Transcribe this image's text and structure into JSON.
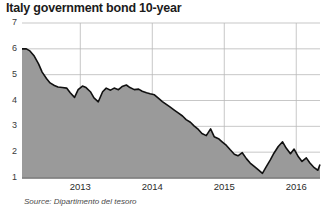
{
  "chart_data": {
    "type": "area",
    "title": "Italy government bond 10-year",
    "subtitle": "",
    "xlabel": "",
    "ylabel": "",
    "source": "Source: Dipartimento del tesoro",
    "ylim": [
      1,
      7
    ],
    "yticks": [
      1,
      2,
      3,
      4,
      5,
      6,
      7
    ],
    "ytick_labels": [
      "1",
      "2",
      "3",
      "4",
      "5",
      "6",
      "7"
    ],
    "xticks": [
      2013,
      2014,
      2015,
      2016
    ],
    "xtick_labels": [
      "2013",
      "2014",
      "2015",
      "2016"
    ],
    "xlim": [
      2012.19,
      2016.33
    ],
    "grid": true,
    "legend": "none",
    "series": [
      {
        "name": "Italy 10-year government bond yield",
        "units": "percent",
        "x": [
          2012.19,
          2012.25,
          2012.3,
          2012.36,
          2012.42,
          2012.47,
          2012.53,
          2012.58,
          2012.64,
          2012.69,
          2012.75,
          2012.81,
          2012.86,
          2012.92,
          2012.97,
          2013.03,
          2013.08,
          2013.14,
          2013.19,
          2013.25,
          2013.31,
          2013.36,
          2013.42,
          2013.47,
          2013.53,
          2013.58,
          2013.64,
          2013.69,
          2013.75,
          2013.81,
          2013.86,
          2013.92,
          2013.97,
          2014.03,
          2014.08,
          2014.14,
          2014.19,
          2014.25,
          2014.31,
          2014.36,
          2014.42,
          2014.47,
          2014.53,
          2014.58,
          2014.64,
          2014.69,
          2014.75,
          2014.81,
          2014.86,
          2014.92,
          2014.97,
          2015.03,
          2015.08,
          2015.14,
          2015.19,
          2015.25,
          2015.31,
          2015.36,
          2015.42,
          2015.47,
          2015.53,
          2015.58,
          2015.64,
          2015.69,
          2015.75,
          2015.81,
          2015.86,
          2015.92,
          2015.97,
          2016.03,
          2016.08,
          2016.14,
          2016.19,
          2016.25,
          2016.3,
          2016.33
        ],
        "values": [
          6.0,
          6.0,
          5.92,
          5.72,
          5.42,
          5.1,
          4.85,
          4.68,
          4.58,
          4.52,
          4.5,
          4.48,
          4.3,
          4.12,
          4.42,
          4.56,
          4.5,
          4.34,
          4.1,
          3.95,
          4.34,
          4.48,
          4.4,
          4.48,
          4.42,
          4.54,
          4.6,
          4.5,
          4.42,
          4.44,
          4.36,
          4.3,
          4.26,
          4.22,
          4.1,
          3.96,
          3.86,
          3.74,
          3.62,
          3.52,
          3.4,
          3.26,
          3.16,
          3.02,
          2.88,
          2.72,
          2.64,
          2.9,
          2.6,
          2.52,
          2.4,
          2.26,
          2.1,
          1.92,
          1.86,
          1.98,
          1.74,
          1.58,
          1.44,
          1.32,
          1.18,
          1.42,
          1.7,
          1.96,
          2.22,
          2.4,
          2.16,
          1.94,
          2.12,
          1.82,
          1.64,
          1.78,
          1.58,
          1.4,
          1.3,
          1.52
        ]
      }
    ],
    "colors": {
      "area_fill": "#9a9a9a",
      "line": "#111111",
      "grid": "#b9b9b9",
      "axis": "#6f6f6f",
      "text": "#1b1b1b",
      "background": "#ffffff"
    }
  }
}
